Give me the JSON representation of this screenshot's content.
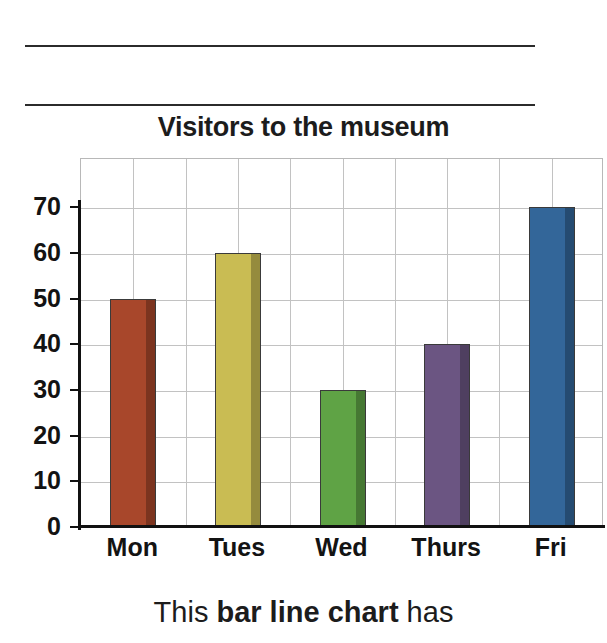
{
  "chart_data": {
    "type": "bar",
    "title": "Visitors to the museum",
    "xlabel": "",
    "ylabel": "",
    "categories": [
      "Mon",
      "Tues",
      "Wed",
      "Thurs",
      "Fri"
    ],
    "values": [
      50,
      60,
      30,
      40,
      70
    ],
    "ylim": [
      0,
      75
    ],
    "yticks": [
      0,
      10,
      20,
      30,
      40,
      50,
      60,
      70
    ],
    "ytick_labels": [
      "0",
      "10",
      "20",
      "30",
      "40",
      "50",
      "60",
      "70"
    ],
    "grid": true,
    "legend": false,
    "bar_colors": [
      "#A8472B",
      "#C9BC53",
      "#5FA345",
      "#6B5582",
      "#336699"
    ],
    "bars": [
      {
        "category": "Mon",
        "value": 50,
        "color": "#A8472B"
      },
      {
        "category": "Tues",
        "value": 60,
        "color": "#C9BC53"
      },
      {
        "category": "Wed",
        "value": 30,
        "color": "#5FA345"
      },
      {
        "category": "Thurs",
        "value": 40,
        "color": "#6B5582"
      },
      {
        "category": "Fri",
        "value": 70,
        "color": "#336699"
      }
    ]
  },
  "caption": {
    "prefix": "This ",
    "emphasis": "bar line chart",
    "suffix": " has"
  },
  "colors": {
    "rule": "#2b2b2b",
    "axis": "#111111",
    "gridline": "#c2c2c2",
    "text": "#1c1c1c"
  }
}
